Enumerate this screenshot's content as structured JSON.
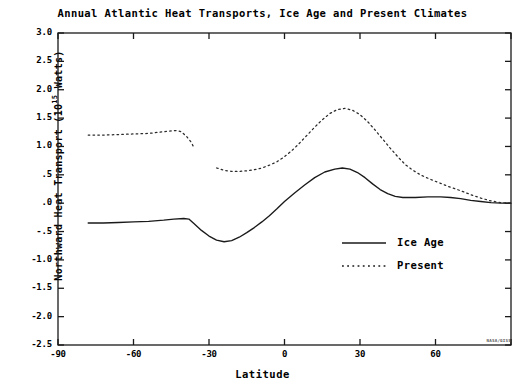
{
  "chart_data": {
    "type": "line",
    "title": "Annual Atlantic Heat Transports, Ice Age and Present Climates",
    "xlabel": "Latitude",
    "ylabel_text": "Northward Heat Transport (10",
    "ylabel_exponent": "15",
    "ylabel_text_end": " Watts)",
    "grid": false,
    "legend_position": "center-right-inside",
    "xlim": [
      -90,
      90
    ],
    "ylim": [
      -2.5,
      3.0
    ],
    "xticks": [
      -90,
      -60,
      -30,
      0,
      30,
      60,
      90
    ],
    "xtick_labels": [
      "-90",
      "-60",
      "-30",
      "0",
      "30",
      "60",
      ""
    ],
    "yticks": [
      3.0,
      2.5,
      2.0,
      1.5,
      1.0,
      0.5,
      0.0,
      -0.5,
      -1.0,
      -1.5,
      -2.0,
      -2.5
    ],
    "ytick_labels": [
      "3.0",
      "2.5",
      "2.0",
      "1.5",
      "1.0",
      ".5",
      ".0",
      "-.5",
      "-1.0",
      "-1.5",
      "-2.0",
      "-2.5"
    ],
    "series": [
      {
        "name": "Ice Age",
        "style": "solid",
        "color": "#1a1a1a",
        "points": [
          [
            -78,
            -0.35
          ],
          [
            -72,
            -0.35
          ],
          [
            -66,
            -0.34
          ],
          [
            -60,
            -0.33
          ],
          [
            -54,
            -0.32
          ],
          [
            -48,
            -0.3
          ],
          [
            -44,
            -0.28
          ],
          [
            -40,
            -0.27
          ],
          [
            -38,
            -0.28
          ],
          [
            -36,
            -0.36
          ],
          [
            -33,
            -0.48
          ],
          [
            -30,
            -0.58
          ],
          [
            -27,
            -0.65
          ],
          [
            -24,
            -0.68
          ],
          [
            -21,
            -0.66
          ],
          [
            -18,
            -0.6
          ],
          [
            -15,
            -0.52
          ],
          [
            -12,
            -0.43
          ],
          [
            -9,
            -0.33
          ],
          [
            -6,
            -0.22
          ],
          [
            -3,
            -0.1
          ],
          [
            0,
            0.03
          ],
          [
            4,
            0.18
          ],
          [
            8,
            0.32
          ],
          [
            12,
            0.45
          ],
          [
            16,
            0.55
          ],
          [
            20,
            0.6
          ],
          [
            23,
            0.62
          ],
          [
            26,
            0.6
          ],
          [
            29,
            0.54
          ],
          [
            32,
            0.45
          ],
          [
            35,
            0.34
          ],
          [
            38,
            0.24
          ],
          [
            41,
            0.17
          ],
          [
            44,
            0.12
          ],
          [
            47,
            0.1
          ],
          [
            52,
            0.1
          ],
          [
            57,
            0.11
          ],
          [
            62,
            0.11
          ],
          [
            66,
            0.1
          ],
          [
            70,
            0.08
          ],
          [
            74,
            0.05
          ],
          [
            78,
            0.03
          ],
          [
            82,
            0.01
          ],
          [
            86,
            0.0
          ],
          [
            90,
            0.0
          ]
        ]
      },
      {
        "name": "Present",
        "style": "dotted",
        "color": "#2a2a2a",
        "segments": [
          [
            [
              -78,
              1.2
            ],
            [
              -72,
              1.2
            ],
            [
              -66,
              1.21
            ],
            [
              -60,
              1.22
            ],
            [
              -54,
              1.23
            ],
            [
              -50,
              1.25
            ],
            [
              -46,
              1.27
            ],
            [
              -43,
              1.28
            ],
            [
              -41,
              1.26
            ],
            [
              -39,
              1.18
            ],
            [
              -37,
              1.07
            ],
            [
              -36,
              0.98
            ]
          ],
          [
            [
              -27,
              0.62
            ],
            [
              -24,
              0.58
            ],
            [
              -21,
              0.56
            ],
            [
              -18,
              0.56
            ],
            [
              -15,
              0.57
            ],
            [
              -12,
              0.59
            ],
            [
              -9,
              0.62
            ],
            [
              -6,
              0.67
            ],
            [
              -3,
              0.73
            ],
            [
              0,
              0.82
            ],
            [
              3,
              0.93
            ],
            [
              6,
              1.06
            ],
            [
              9,
              1.2
            ],
            [
              12,
              1.34
            ],
            [
              15,
              1.47
            ],
            [
              18,
              1.58
            ],
            [
              21,
              1.65
            ],
            [
              24,
              1.67
            ],
            [
              27,
              1.64
            ],
            [
              30,
              1.56
            ],
            [
              33,
              1.44
            ],
            [
              36,
              1.29
            ],
            [
              39,
              1.13
            ],
            [
              42,
              0.97
            ],
            [
              45,
              0.82
            ],
            [
              48,
              0.68
            ],
            [
              51,
              0.58
            ],
            [
              54,
              0.5
            ],
            [
              58,
              0.42
            ],
            [
              62,
              0.35
            ],
            [
              66,
              0.28
            ],
            [
              70,
              0.22
            ],
            [
              74,
              0.15
            ],
            [
              78,
              0.09
            ],
            [
              82,
              0.04
            ],
            [
              86,
              0.01
            ],
            [
              90,
              0.0
            ]
          ]
        ]
      }
    ],
    "legend": [
      {
        "label": "Ice Age",
        "style": "solid"
      },
      {
        "label": "Present",
        "style": "dotted"
      }
    ],
    "credit": "NASA/GISS"
  }
}
